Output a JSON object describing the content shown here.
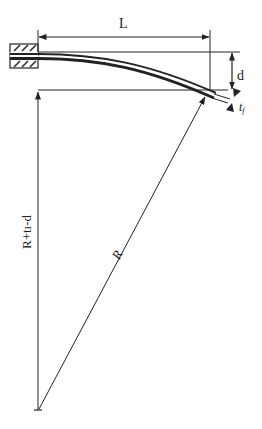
{
  "diagram": {
    "title": "",
    "type": "bent-cantilever-geometry",
    "colors": {
      "ink": "#222222",
      "background": "#ffffff"
    },
    "labels": {
      "length": "L",
      "deflection": "d",
      "thickness": "t",
      "thickness_subscript": "f",
      "vertical_dimension": "R+tı-d",
      "radius": "R"
    },
    "elements": [
      {
        "id": "clamp",
        "description": "hatched fixed support"
      },
      {
        "id": "beam",
        "description": "curved bent layer"
      },
      {
        "id": "length-dimension",
        "label": "L"
      },
      {
        "id": "deflection-dimension",
        "label": "d"
      },
      {
        "id": "thickness-marker",
        "label": "tf"
      },
      {
        "id": "vertical-dimension",
        "label": "R+tı-d"
      },
      {
        "id": "radius-line",
        "label": "R"
      }
    ]
  }
}
